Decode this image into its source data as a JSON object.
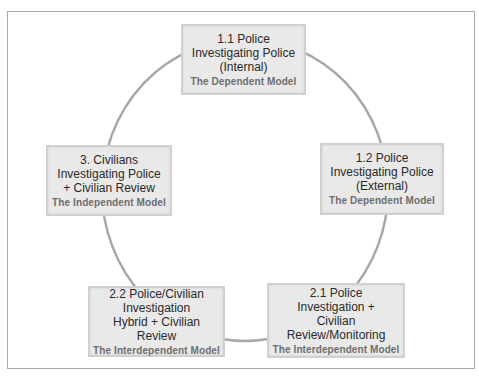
{
  "diagram": {
    "type": "cycle",
    "colors": {
      "ring": "#a8a8a8",
      "box_fill": "#e9e9e9",
      "box_border": "#d0d0d0",
      "title_text": "#2a2a2a",
      "model_text": "#6e6e6e"
    },
    "nodes": [
      {
        "id": "1.1",
        "title": "1.1 Police\nInvestigating Police\n(Internal)",
        "model": "The Dependent Model"
      },
      {
        "id": "1.2",
        "title": "1.2 Police\nInvestigating Police\n(External)",
        "model": "The Dependent Model"
      },
      {
        "id": "2.1",
        "title": "2.1 Police\nInvestigation +\nCivilian\nReview/Monitoring",
        "model": "The Interdependent Model"
      },
      {
        "id": "2.2",
        "title": "2.2 Police/Civilian\nInvestigation\nHybrid + Civilian\nReview",
        "model": "The Interdependent Model"
      },
      {
        "id": "3",
        "title": "3. Civilians\nInvestigating Police\n+ Civilian Review",
        "model": "The Independent Model"
      }
    ]
  }
}
